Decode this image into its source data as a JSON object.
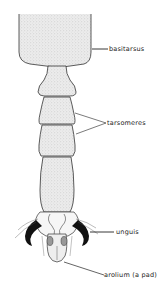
{
  "diagram": {
    "labels": {
      "basitarsus": "basitarsus",
      "tarsomeres": "tarsomeres",
      "unguis": "unguis",
      "arolium": "arolium (a pad)"
    },
    "colors": {
      "fill": "#e6e6e6",
      "outline": "#333333",
      "claw": "#111111",
      "background": "#ffffff"
    }
  }
}
